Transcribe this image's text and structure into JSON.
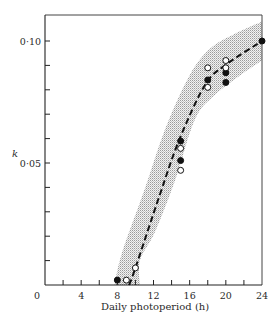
{
  "chart_data": {
    "type": "scatter",
    "title": "",
    "xlabel": "Daily photoperiod (h)",
    "ylabel": "k",
    "xlim": [
      0,
      24
    ],
    "ylim": [
      0,
      0.11
    ],
    "x_ticks": [
      0,
      4,
      8,
      12,
      16,
      20,
      24
    ],
    "x_tick_labels": [
      "0",
      "4",
      "8",
      "12",
      "16",
      "20",
      "24"
    ],
    "x_minor_step": 2,
    "y_ticks": [
      0.05,
      0.1
    ],
    "y_tick_labels": [
      "0·05",
      "0·10"
    ],
    "y_minor_step": 0.01,
    "grid": false,
    "legend": null,
    "series": [
      {
        "name": "filled",
        "marker": "filled-circle",
        "points": [
          {
            "x": 8,
            "y": 0.002
          },
          {
            "x": 15,
            "y": 0.059
          },
          {
            "x": 15,
            "y": 0.051
          },
          {
            "x": 18,
            "y": 0.084
          },
          {
            "x": 20,
            "y": 0.087
          },
          {
            "x": 20,
            "y": 0.083
          },
          {
            "x": 24,
            "y": 0.1
          }
        ]
      },
      {
        "name": "open",
        "marker": "open-circle",
        "points": [
          {
            "x": 9,
            "y": 0.002
          },
          {
            "x": 10,
            "y": 0.007
          },
          {
            "x": 15,
            "y": 0.056
          },
          {
            "x": 15,
            "y": 0.047
          },
          {
            "x": 18,
            "y": 0.089
          },
          {
            "x": 18,
            "y": 0.081
          },
          {
            "x": 20,
            "y": 0.092
          },
          {
            "x": 20,
            "y": 0.089
          }
        ]
      }
    ],
    "fitted_curve": {
      "style": "dashed",
      "points": [
        {
          "x": 9.3,
          "y": 0.0
        },
        {
          "x": 10,
          "y": 0.007
        },
        {
          "x": 12.7,
          "y": 0.037
        },
        {
          "x": 14.9,
          "y": 0.06
        },
        {
          "x": 17.7,
          "y": 0.082
        },
        {
          "x": 19.9,
          "y": 0.09
        },
        {
          "x": 24,
          "y": 0.1
        }
      ]
    },
    "confidence_band": {
      "style": "stippled-grey",
      "upper": [
        {
          "x": 7.7,
          "y": 0.0
        },
        {
          "x": 8.5,
          "y": 0.013
        },
        {
          "x": 11,
          "y": 0.039
        },
        {
          "x": 13.3,
          "y": 0.064
        },
        {
          "x": 16,
          "y": 0.086
        },
        {
          "x": 18.3,
          "y": 0.097
        },
        {
          "x": 21,
          "y": 0.103
        },
        {
          "x": 24,
          "y": 0.108
        }
      ],
      "lower": [
        {
          "x": 10.5,
          "y": 0.0
        },
        {
          "x": 10.5,
          "y": 0.01
        },
        {
          "x": 12.2,
          "y": 0.022
        },
        {
          "x": 14.4,
          "y": 0.043
        },
        {
          "x": 16.6,
          "y": 0.068
        },
        {
          "x": 18.8,
          "y": 0.078
        },
        {
          "x": 21.6,
          "y": 0.086
        },
        {
          "x": 24,
          "y": 0.092
        }
      ]
    }
  }
}
